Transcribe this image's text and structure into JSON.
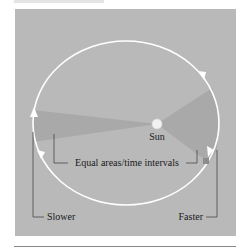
{
  "diagram": {
    "labels": {
      "sun": "Sun",
      "equal_areas": "Equal areas/time intervals",
      "slower": "Slower",
      "faster": "Faster"
    },
    "colors": {
      "panel": "#b9b9b9",
      "orbit": "#ffffff",
      "wedge": "#a5a5a5",
      "sun": "#f0f0f0",
      "planet": "#8c8c8c",
      "leader": "#3a3a3a"
    }
  }
}
